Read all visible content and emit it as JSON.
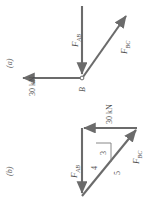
{
  "figure": {
    "caption_a": "(a)",
    "caption_b": "(b)",
    "stroke_color": "#6b6b6b",
    "text_color": "#4f4f4f",
    "background": "#ffffff",
    "rotation_note": "figure printed sideways; all text rotated -90 degrees"
  },
  "panel_a": {
    "tag": "(a)",
    "node_label": "B",
    "members": [
      {
        "name": "F_AB",
        "label_base": "F",
        "label_sub": "AB",
        "direction": "down",
        "description": "vertical arrow pointing down into joint B"
      },
      {
        "name": "F_BC",
        "label_base": "F",
        "label_sub": "BC",
        "direction": "up-right",
        "description": "inclined arrow pointing up and to the right from joint B"
      },
      {
        "name": "load",
        "label": "30 kN",
        "direction": "left",
        "description": "horizontal arrow pointing left from joint B"
      }
    ]
  },
  "panel_b": {
    "tag": "(b)",
    "title_note": "force triangle",
    "members": [
      {
        "name": "load",
        "label": "30 kN",
        "direction": "left",
        "description": "horizontal arrow pointing left along the top of the triangle"
      },
      {
        "name": "F_AB",
        "label_base": "F",
        "label_sub": "AB",
        "direction": "down",
        "description": "vertical arrow pointing down along the left side of the triangle"
      },
      {
        "name": "F_BC",
        "label_base": "F",
        "label_sub": "BC",
        "direction": "up-right",
        "description": "inclined arrow closing the triangle, pointing up and to the right"
      }
    ],
    "slope_triangle": {
      "vertical": "3",
      "horizontal": "4",
      "hypotenuse": "5"
    }
  }
}
